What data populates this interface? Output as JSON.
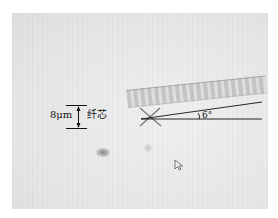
{
  "figure": {
    "type": "microscope image",
    "annotations": {
      "scale_bar_label": "8μm",
      "core_label": "纤芯",
      "angle_label": "6°"
    },
    "colors": {
      "annotation": "#111111",
      "background": "#e6e6e6",
      "vignette": "#050505"
    },
    "cursor_icon": "mouse-pointer-icon"
  }
}
